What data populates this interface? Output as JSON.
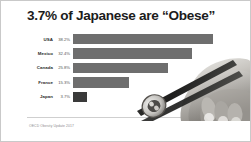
{
  "slide": {
    "title": "3.7% of Japanese are “Obese”",
    "source": "OECD Obesity Update 2017",
    "background_color": "#ffffff",
    "border_color": "#c9c9c9"
  },
  "photo": {
    "name": "hand-holding-chopsticks-with-sushi",
    "description": "Black and white photograph of a hand gripping chopsticks holding a sushi roll"
  },
  "chart_data": {
    "type": "bar",
    "orientation": "horizontal",
    "title": "3.7% of Japanese are “Obese”",
    "xlabel": "",
    "ylabel": "",
    "categories": [
      "USA",
      "Mexico",
      "Canada",
      "France",
      "Japan"
    ],
    "values": [
      38.2,
      32.4,
      25.8,
      15.3,
      3.7
    ],
    "value_labels": [
      "38.2%",
      "32.4%",
      "25.8%",
      "15.3%",
      "3.7%"
    ],
    "xlim": [
      0,
      42
    ],
    "grid": false,
    "legend": false,
    "bar_color": "#6e6e6e",
    "highlight_color": "#3a3a3a",
    "highlight_category": "Japan",
    "source": "OECD Obesity Update 2017"
  }
}
